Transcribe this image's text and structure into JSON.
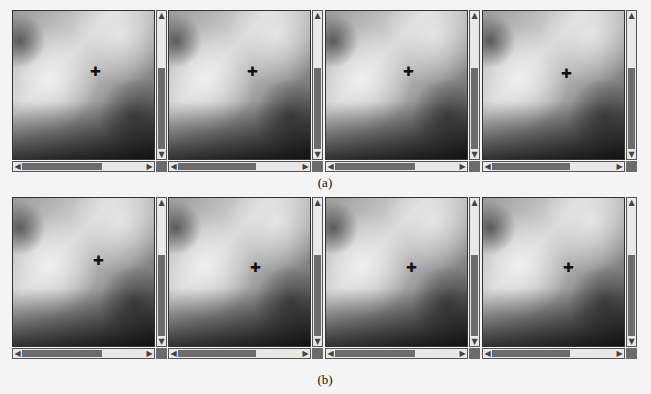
{
  "figure": {
    "rows": [
      {
        "caption": "(a)",
        "panels": [
          {
            "marker": "✚",
            "vthumb_top_pct": 38,
            "hthumb_width_pct": 62
          },
          {
            "marker": "✚",
            "vthumb_top_pct": 38,
            "hthumb_width_pct": 60
          },
          {
            "marker": "✚",
            "vthumb_top_pct": 38,
            "hthumb_width_pct": 62
          },
          {
            "marker": "✚",
            "vthumb_top_pct": 38,
            "hthumb_width_pct": 60
          }
        ]
      },
      {
        "caption": "(b)",
        "panels": [
          {
            "marker": "✚",
            "vthumb_top_pct": 38,
            "hthumb_width_pct": 62
          },
          {
            "marker": "✚",
            "vthumb_top_pct": 38,
            "hthumb_width_pct": 60
          },
          {
            "marker": "✚",
            "vthumb_top_pct": 38,
            "hthumb_width_pct": 62
          },
          {
            "marker": "✚",
            "vthumb_top_pct": 38,
            "hthumb_width_pct": 60
          }
        ]
      }
    ],
    "icons": {
      "up": "▲",
      "down": "▼",
      "left": "◀",
      "right": "▶"
    },
    "colors": {
      "thumb": "#6b6b6b",
      "track": "#e8e8e8",
      "border": "#333333"
    }
  }
}
